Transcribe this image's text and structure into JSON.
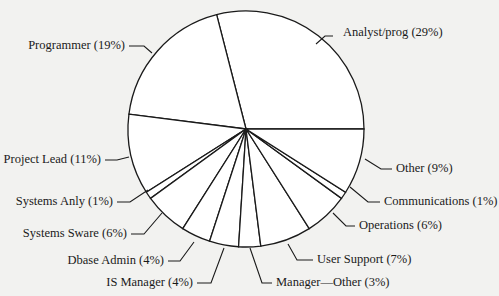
{
  "chart_data": {
    "type": "pie",
    "title": "",
    "start_angle_deg": 0,
    "direction": "counterclockwise",
    "slices": [
      {
        "label": "Analyst/prog",
        "value": 29,
        "display": "Analyst/prog (29%)"
      },
      {
        "label": "Programmer",
        "value": 19,
        "display": "Programmer (19%)"
      },
      {
        "label": "Project Lead",
        "value": 11,
        "display": "Project Lead (11%)"
      },
      {
        "label": "Systems Anly",
        "value": 1,
        "display": "Systems Anly (1%)"
      },
      {
        "label": "Systems Sware",
        "value": 6,
        "display": "Systems Sware (6%)"
      },
      {
        "label": "Dbase Admin",
        "value": 4,
        "display": "Dbase Admin (4%)"
      },
      {
        "label": "IS Manager",
        "value": 4,
        "display": "IS Manager (4%)"
      },
      {
        "label": "Manager—Other",
        "value": 3,
        "display": "Manager—Other (3%)"
      },
      {
        "label": "User Support",
        "value": 7,
        "display": "User Support (7%)"
      },
      {
        "label": "Operations",
        "value": 6,
        "display": "Operations (6%)"
      },
      {
        "label": "Communications",
        "value": 1,
        "display": "Communications (1%)"
      },
      {
        "label": "Other",
        "value": 9,
        "display": "Other (9%)"
      }
    ],
    "legend": "none (external labels with leader lines)",
    "colors": {
      "fill": "#ffffff",
      "stroke": "#1a1a1a",
      "background": "#f2f2f0"
    }
  },
  "layout": {
    "cx": 246,
    "cy": 129,
    "r": 118,
    "labels": [
      {
        "x": 343,
        "y": 36,
        "anchor": "start",
        "leader": [
          [
            333,
            36
          ],
          [
            325,
            36
          ],
          [
            316,
            44
          ]
        ]
      },
      {
        "x": 125,
        "y": 49,
        "anchor": "end",
        "leader": [
          [
            129,
            46
          ],
          [
            144,
            46
          ],
          [
            152,
            53
          ]
        ]
      },
      {
        "x": 101,
        "y": 163,
        "anchor": "end",
        "leader": [
          [
            105,
            160
          ],
          [
            117,
            160
          ],
          [
            129,
            157
          ]
        ]
      },
      {
        "x": 113,
        "y": 205,
        "anchor": "end",
        "leader": [
          [
            117,
            202
          ],
          [
            130,
            202
          ],
          [
            148,
            190
          ]
        ]
      },
      {
        "x": 127,
        "y": 237,
        "anchor": "end",
        "leader": [
          [
            131,
            234
          ],
          [
            144,
            234
          ],
          [
            162,
            213
          ]
        ]
      },
      {
        "x": 164,
        "y": 264,
        "anchor": "end",
        "leader": [
          [
            168,
            261
          ],
          [
            180,
            261
          ],
          [
            194,
            242
          ]
        ]
      },
      {
        "x": 193,
        "y": 286,
        "anchor": "end",
        "leader": [
          [
            197,
            283
          ],
          [
            211,
            283
          ],
          [
            224,
            248
          ]
        ]
      },
      {
        "x": 276,
        "y": 286,
        "anchor": "start",
        "leader": [
          [
            272,
            283
          ],
          [
            262,
            283
          ],
          [
            250,
            248
          ]
        ]
      },
      {
        "x": 317,
        "y": 263,
        "anchor": "start",
        "leader": [
          [
            313,
            260
          ],
          [
            297,
            260
          ],
          [
            288,
            244
          ]
        ]
      },
      {
        "x": 359,
        "y": 229,
        "anchor": "start",
        "leader": [
          [
            355,
            226
          ],
          [
            346,
            226
          ],
          [
            333,
            213
          ]
        ]
      },
      {
        "x": 384,
        "y": 205,
        "anchor": "start",
        "leader": [
          [
            380,
            202
          ],
          [
            368,
            202
          ],
          [
            350,
            187
          ]
        ]
      },
      {
        "x": 396,
        "y": 172,
        "anchor": "start",
        "leader": [
          [
            392,
            169
          ],
          [
            381,
            169
          ],
          [
            365,
            159
          ]
        ]
      }
    ]
  }
}
